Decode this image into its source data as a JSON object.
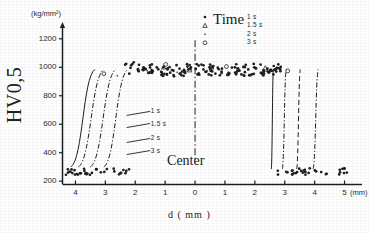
{
  "chart_data": {
    "type": "scatter",
    "title": "",
    "subtitle": "",
    "xlabel": "d  ( mm )",
    "ylabel": "HV0,5",
    "y_unit": "(kg/mm²)",
    "x_unit": "(mm)",
    "xlim": [
      -4.45,
      5.45
    ],
    "ylim": [
      180,
      1290
    ],
    "grid": false,
    "legend_position": "top-right",
    "legend_title": "Time",
    "annotations": [
      {
        "text": "Center",
        "x": 0.0,
        "y": 320
      },
      {
        "text": "1 s",
        "x": -1.55,
        "y": 690
      },
      {
        "text": "1.5 s",
        "x": -1.55,
        "y": 605
      },
      {
        "text": "2 s",
        "x": -1.55,
        "y": 500
      },
      {
        "text": "3 s",
        "x": -1.55,
        "y": 415
      }
    ],
    "xticks": [
      {
        "value": -4,
        "label": "4"
      },
      {
        "value": -3,
        "label": "3"
      },
      {
        "value": -2,
        "label": "2"
      },
      {
        "value": -1,
        "label": "1"
      },
      {
        "value": 0,
        "label": "0"
      },
      {
        "value": 1,
        "label": "1"
      },
      {
        "value": 2,
        "label": "2"
      },
      {
        "value": 3,
        "label": "3"
      },
      {
        "value": 4,
        "label": "4"
      },
      {
        "value": 5,
        "label": "5"
      }
    ],
    "yticks": [
      {
        "value": 200,
        "label": "200"
      },
      {
        "value": 400,
        "label": "400"
      },
      {
        "value": 600,
        "label": "600"
      },
      {
        "value": 800,
        "label": "800"
      },
      {
        "value": 1000,
        "label": "1000"
      },
      {
        "value": 1200,
        "label": "1200"
      }
    ],
    "legend": [
      {
        "label": "1 s",
        "marker": "dot"
      },
      {
        "label": "1.5 s",
        "marker": "triangle"
      },
      {
        "label": "2 s",
        "marker": "small-dot"
      },
      {
        "label": "3 s",
        "marker": "circle"
      }
    ],
    "series": [
      {
        "name": "1 s",
        "marker": "dot",
        "points": [
          [
            -4.25,
            260
          ],
          [
            -3.95,
            250
          ],
          [
            -3.7,
            272
          ],
          [
            -3.45,
            258
          ],
          [
            -3.15,
            262
          ],
          [
            -2.95,
            285
          ],
          [
            -2.7,
            268
          ],
          [
            -2.5,
            256
          ],
          [
            -2.3,
            272
          ],
          [
            -2.2,
            955
          ],
          [
            -2.05,
            1035
          ],
          [
            -1.9,
            980
          ],
          [
            -1.72,
            995
          ],
          [
            -1.5,
            965
          ],
          [
            -1.28,
            1000
          ],
          [
            -1.1,
            955
          ],
          [
            -0.92,
            985
          ],
          [
            -0.72,
            945
          ],
          [
            -0.52,
            990
          ],
          [
            -0.33,
            960
          ],
          [
            -0.14,
            1000
          ],
          [
            0.08,
            950
          ],
          [
            0.28,
            985
          ],
          [
            0.48,
            1000
          ],
          [
            0.68,
            955
          ],
          [
            0.9,
            990
          ],
          [
            1.12,
            960
          ],
          [
            1.33,
            1000
          ],
          [
            1.55,
            950
          ],
          [
            1.78,
            985
          ],
          [
            1.98,
            1000
          ],
          [
            2.2,
            960
          ],
          [
            2.42,
            990
          ],
          [
            2.62,
            950
          ],
          [
            2.85,
            985
          ],
          [
            3.05,
            265
          ],
          [
            3.3,
            255
          ],
          [
            3.55,
            272
          ],
          [
            3.8,
            258
          ],
          [
            4.05,
            268
          ],
          [
            4.4,
            252
          ],
          [
            4.85,
            262
          ]
        ]
      },
      {
        "name": "1.5 s",
        "marker": "triangle",
        "points": [
          [
            -1.05,
            1000
          ],
          [
            -0.18,
            980
          ],
          [
            0.55,
            1000
          ],
          [
            1.45,
            985
          ],
          [
            2.35,
            995
          ]
        ]
      },
      {
        "name": "2 s",
        "marker": "small-dot",
        "points": [
          [
            -2.6,
            940
          ],
          [
            -1.6,
            975
          ],
          [
            -0.6,
            965
          ],
          [
            0.4,
            975
          ],
          [
            1.4,
            960
          ],
          [
            2.55,
            985
          ]
        ]
      },
      {
        "name": "3 s",
        "marker": "circle",
        "points": [
          [
            -3.05,
            955
          ],
          [
            -0.98,
            1020
          ],
          [
            1.05,
            1005
          ],
          [
            3.1,
            975
          ]
        ]
      }
    ],
    "transition_curves": {
      "left": [
        {
          "name": "1 s",
          "x_top": -2.25,
          "x_bottom": -3.05,
          "style": "dashdot"
        },
        {
          "name": "1.5 s",
          "x_top": -2.65,
          "x_bottom": -3.5,
          "style": "dashdot"
        },
        {
          "name": "2 s",
          "x_top": -3.05,
          "x_bottom": -3.9,
          "style": "dashdot"
        },
        {
          "name": "3 s",
          "x_top": -3.35,
          "x_bottom": -4.15,
          "style": "solid"
        }
      ],
      "right": [
        {
          "name": "1 s",
          "x_top": 2.55,
          "x_bottom": 2.62,
          "style": "solid"
        },
        {
          "name": "1.5 s",
          "x_top": 2.92,
          "x_bottom": 3.05,
          "style": "dashdot"
        },
        {
          "name": "2 s",
          "x_top": 3.4,
          "x_bottom": 3.52,
          "style": "dashed"
        },
        {
          "name": "3 s",
          "x_top": 3.95,
          "x_bottom": 4.12,
          "style": "dashdot"
        }
      ],
      "center_line": {
        "x": 0.0,
        "style": "dashdot",
        "label": "Center"
      }
    }
  }
}
